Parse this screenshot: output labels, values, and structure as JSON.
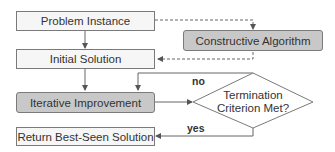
{
  "diagram": {
    "type": "flowchart",
    "nodes": {
      "problem_instance": "Problem Instance",
      "constructive_algorithm": "Constructive Algorithm",
      "initial_solution": "Initial Solution",
      "iterative_improvement": "Iterative Improvement",
      "termination_line1": "Termination",
      "termination_line2": "Criterion Met?",
      "return_best": "Return Best-Seen Solution"
    },
    "edge_labels": {
      "no": "no",
      "yes": "yes"
    },
    "colors": {
      "light_fill": "#f6f6f6",
      "dark_fill": "#c8c8c8",
      "stroke": "#7a7a7a",
      "text": "#333333"
    }
  }
}
